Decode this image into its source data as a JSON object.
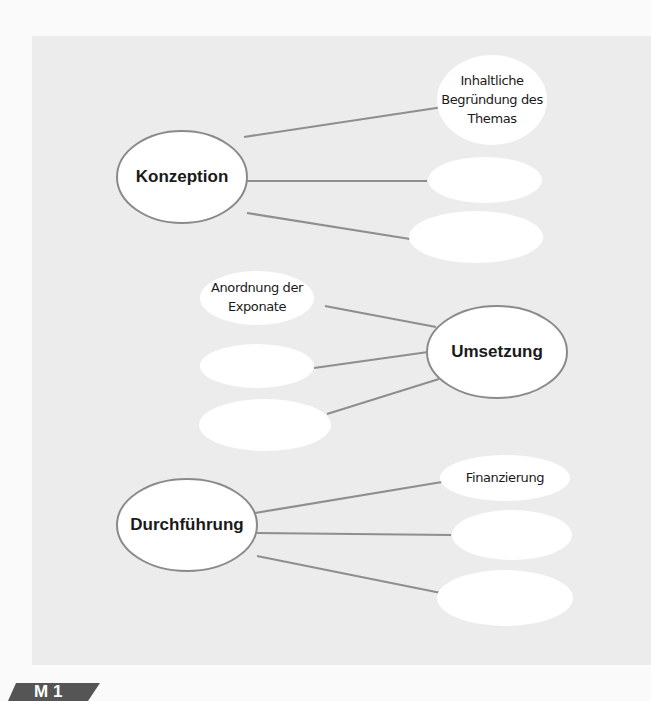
{
  "diagram": {
    "main_nodes": [
      {
        "label": "Konzeption",
        "cx": 182,
        "cy": 177,
        "rx": 65,
        "ry": 46
      },
      {
        "label": "Umsetzung",
        "cx": 497,
        "cy": 352,
        "rx": 70,
        "ry": 46
      },
      {
        "label": "Durchführung",
        "cx": 187,
        "cy": 525,
        "rx": 70,
        "ry": 46
      }
    ],
    "sub_nodes": [
      {
        "parent": "Konzeption",
        "label": "Inhaltliche\nBegründung des\nThemas",
        "lines": [
          "Inhaltliche",
          "Begründung des",
          "Themas"
        ],
        "cx": 492,
        "cy": 100,
        "rx": 55,
        "ry": 45
      },
      {
        "parent": "Konzeption",
        "label": "",
        "cx": 485,
        "cy": 180,
        "rx": 57,
        "ry": 23
      },
      {
        "parent": "Konzeption",
        "label": "",
        "cx": 476,
        "cy": 237,
        "rx": 67,
        "ry": 26
      },
      {
        "parent": "Umsetzung",
        "label": "Anordnung der\nExponate",
        "lines": [
          "Anordnung der",
          "Exponate"
        ],
        "cx": 257,
        "cy": 298,
        "rx": 57,
        "ry": 27
      },
      {
        "parent": "Umsetzung",
        "label": "",
        "cx": 257,
        "cy": 366,
        "rx": 57,
        "ry": 22
      },
      {
        "parent": "Umsetzung",
        "label": "",
        "cx": 265,
        "cy": 425,
        "rx": 66,
        "ry": 26
      },
      {
        "parent": "Durchführung",
        "label": "Finanzierung",
        "lines": [
          "Finanzierung"
        ],
        "cx": 505,
        "cy": 478,
        "rx": 65,
        "ry": 23
      },
      {
        "parent": "Durchführung",
        "label": "",
        "cx": 512,
        "cy": 535,
        "rx": 60,
        "ry": 25
      },
      {
        "parent": "Durchführung",
        "label": "",
        "cx": 505,
        "cy": 598,
        "rx": 68,
        "ry": 28
      }
    ],
    "connectors": [
      {
        "from": "Konzeption",
        "x1": 244,
        "y1": 137,
        "x2": 443,
        "y2": 107
      },
      {
        "from": "Konzeption",
        "x1": 247,
        "y1": 181,
        "x2": 427,
        "y2": 181
      },
      {
        "from": "Konzeption",
        "x1": 247,
        "y1": 213,
        "x2": 410,
        "y2": 239
      },
      {
        "from": "Umsetzung",
        "x1": 436,
        "y1": 327,
        "x2": 325,
        "y2": 306
      },
      {
        "from": "Umsetzung",
        "x1": 428,
        "y1": 352,
        "x2": 314,
        "y2": 368
      },
      {
        "from": "Umsetzung",
        "x1": 439,
        "y1": 379,
        "x2": 327,
        "y2": 414
      },
      {
        "from": "Durchführung",
        "x1": 255,
        "y1": 513,
        "x2": 442,
        "y2": 482
      },
      {
        "from": "Durchführung",
        "x1": 257,
        "y1": 533,
        "x2": 451,
        "y2": 535
      },
      {
        "from": "Durchführung",
        "x1": 257,
        "y1": 556,
        "x2": 441,
        "y2": 593
      }
    ],
    "colors": {
      "panel": "#ececec",
      "page": "#fafafa",
      "line": "#8e8e8e",
      "ellipse_fill": "#ffffff",
      "ellipse_stroke": "#8a8a8a",
      "tag": "#555555"
    }
  },
  "tag": {
    "label": "M 1"
  }
}
